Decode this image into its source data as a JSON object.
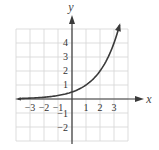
{
  "chart_data": {
    "type": "line",
    "title": "",
    "xlabel": "x",
    "ylabel": "y",
    "xlim": [
      -4,
      4
    ],
    "ylim": [
      -3,
      5
    ],
    "grid": true,
    "x_tick_labels": [
      "-3",
      "-2",
      "-1",
      "1",
      "2",
      "3"
    ],
    "y_tick_labels": [
      "4",
      "3",
      "2",
      "1",
      "-1",
      "-2"
    ],
    "series": [
      {
        "name": "exponential curve",
        "x": [
          -3.8,
          -3,
          -2,
          -1,
          0,
          1,
          2,
          3,
          3.4
        ],
        "y": [
          0.036,
          0.0625,
          0.125,
          0.25,
          0.5,
          1,
          2,
          4,
          5.28
        ],
        "arrow_end": true
      }
    ]
  },
  "axes": {
    "x_label": "x",
    "y_label": "y"
  },
  "colors": {
    "grid": "#d4d4d4",
    "axis": "#3a3a3a",
    "curve": "#3a3a3a",
    "text": "#333333"
  }
}
